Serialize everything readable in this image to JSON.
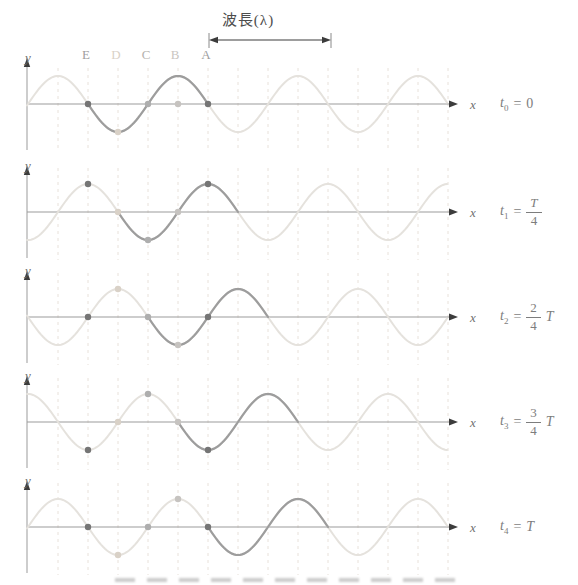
{
  "figure": {
    "width": 578,
    "height": 585,
    "background": "#ffffff",
    "wavelength_annotation": {
      "label": "波長(λ)",
      "from_x": 209,
      "to_x": 331,
      "arrow_y": 40,
      "tick_top": 33,
      "tick_bottom": 48,
      "text_color": "#4d4d4d",
      "arrow_color": "#3c3c3c",
      "tick_color": "#8a8a8a"
    },
    "point_labels": [
      {
        "text": "E",
        "x": 86,
        "color": "#9e9e9e"
      },
      {
        "text": "D",
        "x": 116,
        "color": "#d9d1c7"
      },
      {
        "text": "C",
        "x": 146,
        "color": "#b5b2ae"
      },
      {
        "text": "B",
        "x": 175,
        "color": "#c9c6c2"
      },
      {
        "text": "A",
        "x": 206,
        "color": "#9e9e9e"
      }
    ],
    "axes": {
      "x_label": "x",
      "y_label": "y",
      "line_color": "#9b9b9b",
      "arrow_color": "#3c3c3c",
      "label_color": "#6f6f6f"
    },
    "grid": {
      "start_x": 58,
      "step": 30,
      "count": 14,
      "color": "#e8e1da",
      "top_offset": -44,
      "first_panel_top_offset": -36,
      "bottom_offset": 48
    }
  },
  "chart_data": {
    "type": "line",
    "wavelength_px": 120,
    "amplitude_px": 28,
    "wave_zero_x": 88,
    "wave_start_x": 27,
    "wave_end_x": 448,
    "highlight_length_px": 120,
    "x_axis_start": 27,
    "x_axis_end": 451,
    "x_arrow_tip": 458,
    "x_label_x": 470,
    "time_label_x": 500,
    "y_axis_x": 27,
    "colors": {
      "wave_light": "#e5e2dd",
      "wave_dark": "#9d9d9d"
    },
    "particles": [
      {
        "name": "A",
        "x": 208,
        "color": "#757575"
      },
      {
        "name": "B",
        "x": 178,
        "color": "#c6c3c0"
      },
      {
        "name": "C",
        "x": 148,
        "color": "#aeaeae"
      },
      {
        "name": "D",
        "x": 118,
        "color": "#d9d1c7"
      },
      {
        "name": "E",
        "x": 88,
        "color": "#757575"
      }
    ],
    "panels": [
      {
        "baseline_y": 104,
        "phase_shift_px": 0,
        "highlight_from_x": 88,
        "time": {
          "lhs": "t",
          "sub": "0",
          "eq": "=",
          "type": "plain",
          "value": "0"
        },
        "dots": [
          {
            "p": "E",
            "dy": 0
          },
          {
            "p": "D",
            "dy": -28
          },
          {
            "p": "C",
            "dy": 0
          },
          {
            "p": "B",
            "dy": 0
          },
          {
            "p": "A",
            "dy": 0
          }
        ]
      },
      {
        "baseline_y": 212,
        "phase_shift_px": 30,
        "highlight_from_x": 118,
        "time": {
          "lhs": "t",
          "sub": "1",
          "eq": "=",
          "type": "frac",
          "num": "T",
          "den": "4",
          "suffix": ""
        },
        "dots": [
          {
            "p": "E",
            "dy": 28
          },
          {
            "p": "D",
            "dy": 0
          },
          {
            "p": "C",
            "dy": -28
          },
          {
            "p": "B",
            "dy": 0
          },
          {
            "p": "A",
            "dy": 28
          }
        ]
      },
      {
        "baseline_y": 317,
        "phase_shift_px": 60,
        "highlight_from_x": 148,
        "time": {
          "lhs": "t",
          "sub": "2",
          "eq": "=",
          "type": "frac",
          "num": "2",
          "den": "4",
          "suffix": "T"
        },
        "dots": [
          {
            "p": "E",
            "dy": 0
          },
          {
            "p": "D",
            "dy": 28
          },
          {
            "p": "C",
            "dy": 0
          },
          {
            "p": "B",
            "dy": -28
          },
          {
            "p": "A",
            "dy": 0
          }
        ]
      },
      {
        "baseline_y": 422,
        "phase_shift_px": 90,
        "highlight_from_x": 178,
        "time": {
          "lhs": "t",
          "sub": "3",
          "eq": "=",
          "type": "frac",
          "num": "3",
          "den": "4",
          "suffix": "T"
        },
        "dots": [
          {
            "p": "E",
            "dy": -28
          },
          {
            "p": "D",
            "dy": 0
          },
          {
            "p": "C",
            "dy": 28
          },
          {
            "p": "B",
            "dy": 0
          },
          {
            "p": "A",
            "dy": -28
          }
        ]
      },
      {
        "baseline_y": 527,
        "phase_shift_px": 120,
        "highlight_from_x": 208,
        "time": {
          "lhs": "t",
          "sub": "4",
          "eq": "=",
          "type": "plain",
          "value": "T"
        },
        "dots": [
          {
            "p": "E",
            "dy": 0
          },
          {
            "p": "D",
            "dy": -28
          },
          {
            "p": "C",
            "dy": 0
          },
          {
            "p": "B",
            "dy": 28
          },
          {
            "p": "A",
            "dy": 0
          }
        ]
      }
    ]
  }
}
